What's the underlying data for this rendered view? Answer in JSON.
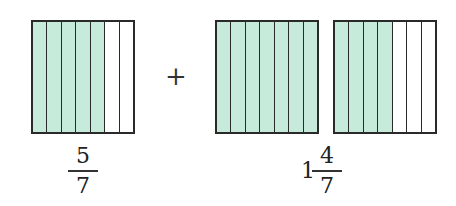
{
  "colors": {
    "shaded": "#c6ebdb",
    "unshaded": "#ffffff",
    "stroke": "#2a2a2a"
  },
  "models": [
    {
      "id": "model-a",
      "parts": 7,
      "shaded": 5,
      "left": 31
    },
    {
      "id": "model-b1",
      "parts": 7,
      "shaded": 7,
      "left": 215
    },
    {
      "id": "model-b2",
      "parts": 7,
      "shaded": 4,
      "left": 333
    }
  ],
  "operator": "+",
  "labels": {
    "left": {
      "numerator": "5",
      "denominator": "7"
    },
    "right": {
      "whole": "1",
      "numerator": "4",
      "denominator": "7"
    }
  }
}
